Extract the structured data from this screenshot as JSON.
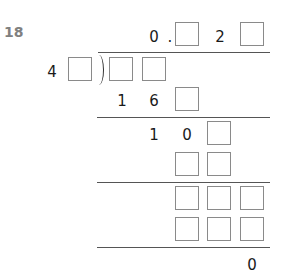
{
  "problem": {
    "number": "18",
    "quotient": {
      "digits": [
        "0",
        ".",
        "",
        "2",
        ""
      ]
    },
    "divisor": {
      "digits": [
        "4",
        ""
      ]
    },
    "dividend": {
      "digits": [
        "",
        ""
      ]
    },
    "steps": [
      {
        "row": [
          "1",
          "6",
          ""
        ]
      },
      {
        "row": [
          "1",
          "0",
          ""
        ]
      },
      {
        "row": [
          "",
          ""
        ]
      },
      {
        "row": [
          "",
          "",
          ""
        ]
      },
      {
        "row": [
          "",
          "",
          ""
        ]
      }
    ],
    "remainder": "0"
  },
  "colors": {
    "text": "#1a1a1a",
    "number": "#808080",
    "box_border": "#8a8a8a",
    "rule": "#555555"
  }
}
